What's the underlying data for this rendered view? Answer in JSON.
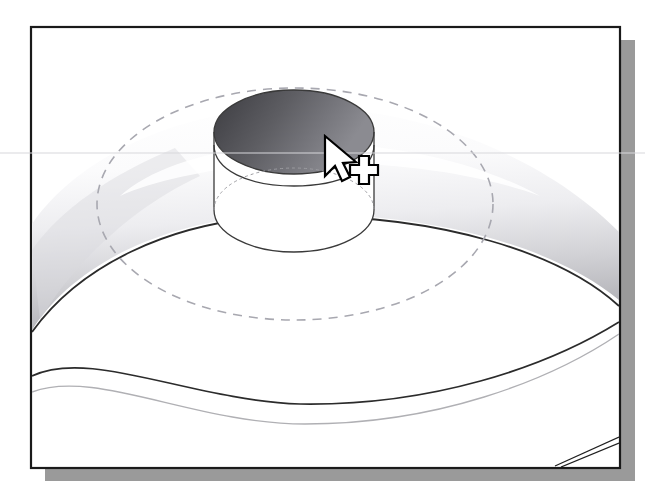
{
  "screenshot": {
    "width": 645,
    "height": 497,
    "page_background": "#ffffff",
    "description": "CAD solid-modeling viewport illustration showing a shaded circular part with a cylindrical boss and dashed hidden-line circle, with an arrow-plus-crosshair selection cursor"
  },
  "viewport_frame": {
    "name": "cad-viewport",
    "x": 31,
    "y": 27,
    "width": 589,
    "height": 441,
    "fill": "#ffffff",
    "border_color": "#1a1a1a",
    "border_width": 2,
    "shadow_color": "#9a9a9a",
    "shadow_offset_x": 14,
    "shadow_offset_y": 13
  },
  "scan_artifact_line": {
    "name": "scan-artifact-line",
    "y": 153,
    "color": "#d8d8dc",
    "width": 1,
    "spans_full_image": true
  },
  "geometry": {
    "hidden_circle": {
      "name": "hidden-line-ellipse",
      "label": "Hidden line circle (dashed)",
      "center_x": 295,
      "center_y": 204,
      "radius_x": 198,
      "radius_y": 116,
      "stroke": "#a8a8b0",
      "stroke_width": 1.6,
      "dash_pattern": "9 7",
      "line_type": "hidden"
    },
    "boss_cylinder": {
      "name": "boss-cylinder",
      "label": "Cylindrical boss / counterbore",
      "center_x": 294,
      "top_ellipse_y": 132,
      "bottom_ellipse_y": 210,
      "radius_x": 80,
      "radius_y": 42,
      "height": 78,
      "top_face_fill": "#ffffff",
      "inner_wall_dark": "#4e4e52",
      "inner_wall_light": "#8e8e92",
      "outline_stroke": "#3a3a3a",
      "outline_width": 1.3
    },
    "shaded_band": {
      "name": "shaded-ring-surface",
      "label": "Shaded toroidal ring surface",
      "highlight_color": "#ffffff",
      "mid_tone": "#e2e2e4",
      "shade_tone": "#b8b8bc",
      "edge_stroke": "#2b2b2b",
      "edge_width": 1.8
    },
    "lower_arcs": [
      {
        "name": "lower-arc-dark",
        "label": "Lower edge arc (visible)",
        "stroke": "#2b2b2b",
        "stroke_width": 1.7,
        "line_type": "visible"
      },
      {
        "name": "lower-arc-light",
        "label": "Lower edge arc (tangent / silhouette)",
        "stroke": "#b0b0b4",
        "stroke_width": 1.4,
        "line_type": "silhouette"
      }
    ],
    "corner_detail": {
      "name": "corner-chamfer-lines",
      "label": "Chamfer edge pair at lower-right corner",
      "stroke": "#1f1f1f",
      "stroke_width": 1.3,
      "count": 2
    }
  },
  "cursor": {
    "name": "selection-cursor",
    "label": "Arrow pointer with crosshair selection marker",
    "arrow_tip_x": 325,
    "arrow_tip_y": 138,
    "crosshair_center_x": 355,
    "crosshair_center_y": 171,
    "fill": "#ffffff",
    "stroke": "#000000",
    "glyph": "arrow-plus-crosshair"
  },
  "palette": {
    "frame_border": "#1a1a1a",
    "drop_shadow": "#9a9a9a",
    "hidden_line": "#a8a8b0",
    "visible_line": "#2b2b2b",
    "dark_shade": "#4e4e52",
    "light_shade": "#e2e2e4",
    "paper_white": "#ffffff"
  }
}
